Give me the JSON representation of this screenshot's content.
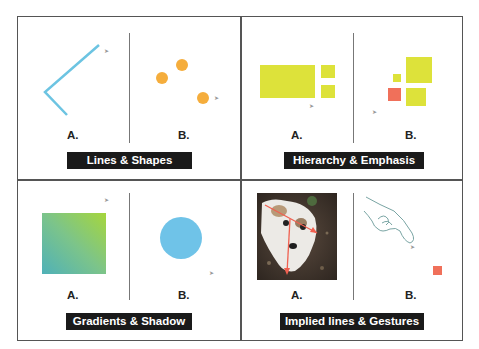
{
  "panels": [
    {
      "title": "Lines & Shapes",
      "label_a": "A.",
      "label_b": "B.",
      "a_desc": "blue angled polyline",
      "b_desc": "three orange dots"
    },
    {
      "title": "Hierarchy & Emphasis",
      "label_a": "A.",
      "label_b": "B.",
      "a_desc": "large yellow-green rectangle with two small squares",
      "b_desc": "cluster of yellow-green squares with one red square"
    },
    {
      "title": "Gradients & Shadow",
      "label_a": "A.",
      "label_b": "B.",
      "a_desc": "teal-to-green gradient square",
      "b_desc": "flat light blue circle"
    },
    {
      "title": "Implied lines & Gestures",
      "label_a": "A.",
      "label_b": "B.",
      "a_desc": "dog photo with red implied-line arrows",
      "b_desc": "pointing hand sketch with small red square"
    }
  ],
  "colors": {
    "line_blue": "#6cc4e2",
    "dot_orange": "#f5ad3c",
    "yellow_green": "#dde23a",
    "emphasis_red": "#f0705a",
    "gradient_start": "#4fb1b8",
    "gradient_end": "#a6d63c",
    "circle_blue": "#6fc3e8",
    "title_bg": "#1a1a1a",
    "title_fg": "#ffffff",
    "frame": "#555555"
  }
}
